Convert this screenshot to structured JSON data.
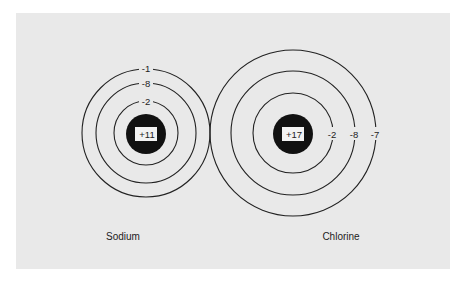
{
  "colors": {
    "background": "#e9e9e9",
    "ink": "#222222",
    "nucleus": "#111111",
    "nucleus_label_bg": "#f2f2f2"
  },
  "atoms": [
    {
      "name": "Sodium",
      "nucleus_charge": "+11",
      "shells": [
        "-2",
        "-8",
        "-1"
      ]
    },
    {
      "name": "Chlorine",
      "nucleus_charge": "+17",
      "shells": [
        "-2",
        "-8",
        "-7"
      ]
    }
  ]
}
